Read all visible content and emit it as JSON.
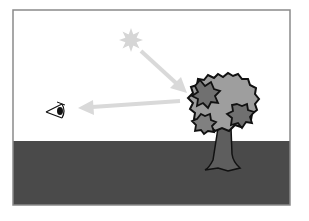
{
  "diagram": {
    "elements": [
      {
        "name": "sun",
        "icon": "sun-icon"
      },
      {
        "name": "incident-light-ray",
        "icon": "arrow-icon",
        "from": "sun",
        "to": "tree"
      },
      {
        "name": "tree",
        "icon": "tree-icon"
      },
      {
        "name": "reflected-light-ray",
        "icon": "arrow-icon",
        "from": "tree",
        "to": "eye"
      },
      {
        "name": "eye",
        "icon": "eye-icon"
      },
      {
        "name": "ground"
      }
    ],
    "colors": {
      "sky": "#ffffff",
      "ground": "#4a4a4a",
      "frame": "#888888",
      "sun": "#d4d4d4",
      "ray": "#d9d9d9",
      "foliage_light": "#9e9e9e",
      "foliage_dark": "#6e6e6e",
      "trunk": "#5e5e5e",
      "outline": "#111111"
    }
  }
}
